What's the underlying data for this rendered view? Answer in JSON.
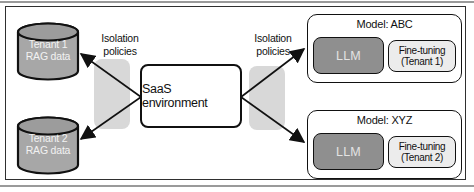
{
  "figure": {
    "type": "architecture-diagram",
    "description_visible_text_only": true
  },
  "tenants": [
    {
      "db_label": "Tenant 1\nRAG data"
    },
    {
      "db_label": "Tenant 2\nRAG data"
    }
  ],
  "saas": {
    "label": "SaaS environment"
  },
  "isolation": {
    "left_label": "Isolation\npolicies",
    "right_label": "Isolation\npolicies"
  },
  "models": [
    {
      "title": "Model: ABC",
      "llm": "LLM",
      "finetune": "Fine-tuning\n(Tenant 1)"
    },
    {
      "title": "Model: XYZ",
      "llm": "LLM",
      "finetune": "Fine-tuning\n(Tenant 2)"
    }
  ],
  "colors": {
    "frame_border": "#2f2f2f",
    "page_rule": "#9a9a9a",
    "cylinder_fill": "#a7a7a7",
    "cylinder_top_fill": "#9c9c9c",
    "cylinder_text": "#f2f2f2",
    "barrier_fill": "#d8d8d8",
    "saas_fill": "#ffffff",
    "llm_fill": "#8f8f8f",
    "llm_text": "#e3e3e3",
    "finetune_fill": "#ececec",
    "outline": "#111111",
    "arrow": "#111111"
  }
}
